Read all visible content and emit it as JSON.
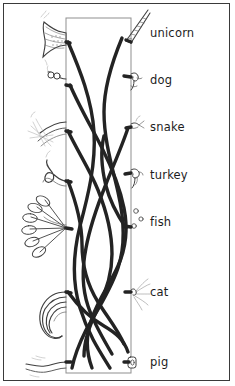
{
  "puzzle": {
    "title_text": "",
    "outer_frame": {
      "present": true,
      "color": "#3a3a3a"
    },
    "center_box": {
      "present": true,
      "color": "#8a8a8a",
      "x": 66,
      "y": 18,
      "width": 65,
      "height": 355
    },
    "line_color": "#232323",
    "sketch_color": "#4a4a4a",
    "faint_color": "#9b9b9b",
    "labels": [
      {
        "text": "unicorn",
        "x": 150,
        "y": 33,
        "tail_art": "fish-tail-shape-top-left",
        "head_art": "unicorn-horn-icon"
      },
      {
        "text": "dog",
        "x": 150,
        "y": 80,
        "tail_art": "curly-short-tail",
        "head_art": "dog-head-icon"
      },
      {
        "text": "snake",
        "x": 150,
        "y": 127,
        "tail_art": "feather-spray-tail",
        "head_art": "snake-head-icon"
      },
      {
        "text": "turkey",
        "x": 150,
        "y": 175,
        "tail_art": "wavy-snake-tail",
        "head_art": "turkey-head-icon"
      },
      {
        "text": "fish",
        "x": 150,
        "y": 222,
        "tail_art": "turkey-fan-tail",
        "head_art": "fish-bubbles-icon"
      },
      {
        "text": "cat",
        "x": 150,
        "y": 292,
        "tail_art": "horse-hair-tail",
        "head_art": "cat-whiskers-icon"
      },
      {
        "text": "pig",
        "x": 150,
        "y": 362,
        "tail_art": "wavy-line-tail",
        "head_art": "pig-snout-icon"
      }
    ],
    "tails": [
      {
        "name": "fish-tail-shape-top-left",
        "y": 36
      },
      {
        "name": "curly-short-tail",
        "y": 74
      },
      {
        "name": "feather-spray-tail",
        "y": 126
      },
      {
        "name": "wavy-snake-tail",
        "y": 166
      },
      {
        "name": "turkey-fan-tail",
        "y": 228
      },
      {
        "name": "horse-hair-tail",
        "y": 318
      },
      {
        "name": "wavy-line-tail",
        "y": 365
      }
    ],
    "strands": {
      "count": 7,
      "style": "thick-tangled-curves"
    }
  }
}
